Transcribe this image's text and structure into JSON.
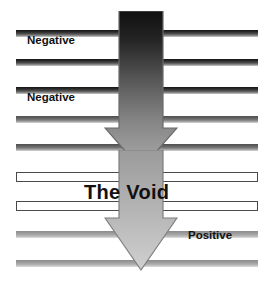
{
  "diagram": {
    "title": "The Void",
    "background_color": "#ffffff",
    "labels": [
      {
        "text": "Negative",
        "x": 27,
        "y": 34,
        "size": "small"
      },
      {
        "text": "Negative",
        "x": 27,
        "y": 91,
        "size": "small"
      },
      {
        "text": "The Void",
        "x": 84,
        "y": 181,
        "size": "big"
      },
      {
        "text": "Positive",
        "x": 188,
        "y": 229,
        "size": "small"
      }
    ],
    "bars": [
      {
        "y": 30,
        "tone": "dark"
      },
      {
        "y": 59,
        "tone": "dark"
      },
      {
        "y": 87,
        "tone": "dark"
      },
      {
        "y": 116,
        "tone": "mid"
      },
      {
        "y": 144,
        "tone": "mid"
      },
      {
        "y": 231,
        "tone": "light"
      },
      {
        "y": 260,
        "tone": "light"
      }
    ],
    "hollow_bars": [
      {
        "y": 172
      },
      {
        "y": 201
      }
    ],
    "arrows": [
      {
        "name": "upper-arrow",
        "label": "downward-arrow-upper",
        "x": 104,
        "y": 11,
        "width": 74,
        "height": 160,
        "gradient_from": "#141414",
        "gradient_to": "#a7a7a7",
        "outline": "#6f6f6f"
      },
      {
        "name": "lower-arrow",
        "label": "downward-arrow-lower",
        "x": 104,
        "y": 150,
        "width": 74,
        "height": 122,
        "gradient_from": "#9a9a9a",
        "gradient_to": "#cccccc",
        "outline": "#7a7a7a"
      }
    ],
    "bar_colors": {
      "dark_top": "#151515",
      "dark_bottom": "#cfcfcf",
      "mid_top": "#4f4f4f",
      "light_top": "#8c8c8c",
      "hollow_border": "#4a4a4a",
      "hollow_fill": "#ffffff"
    }
  }
}
